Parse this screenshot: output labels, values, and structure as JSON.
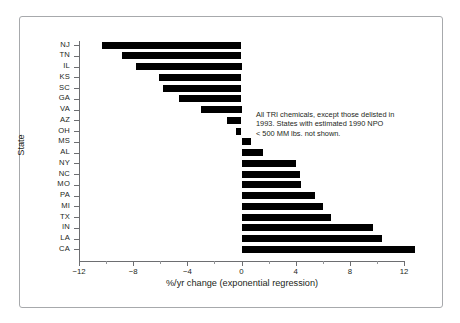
{
  "chart_data": {
    "type": "bar",
    "orientation": "horizontal",
    "title": "",
    "xlabel": "%/yr change (exponential regression)",
    "ylabel": "State",
    "xlim": [
      -12,
      12
    ],
    "xticks": [
      -12,
      -8,
      -4,
      0,
      4,
      8,
      12
    ],
    "xtick_labels": [
      "−12",
      "−8",
      "−4",
      "0",
      "4",
      "8",
      "12"
    ],
    "xticks_minor": [
      -10,
      -6,
      -2,
      2,
      6,
      10
    ],
    "grid": false,
    "legend": null,
    "bar_color": "#000000",
    "categories": [
      "NJ",
      "TN",
      "IL",
      "KS",
      "SC",
      "GA",
      "VA",
      "AZ",
      "OH",
      "MS",
      "AL",
      "NY",
      "NC",
      "MO",
      "PA",
      "MI",
      "TX",
      "IN",
      "LA",
      "CA"
    ],
    "values": [
      -10.3,
      -8.8,
      -7.8,
      -6.1,
      -5.8,
      -4.6,
      -3.0,
      -1.1,
      -0.4,
      0.7,
      1.6,
      4.0,
      4.3,
      4.4,
      5.4,
      6.0,
      6.6,
      9.7,
      10.4,
      12.8
    ],
    "annotations": [
      "All TRI chemicals, except those delisted in",
      "1993. States with estimated 1990 NPO",
      "< 500 MM lbs. not shown."
    ]
  }
}
